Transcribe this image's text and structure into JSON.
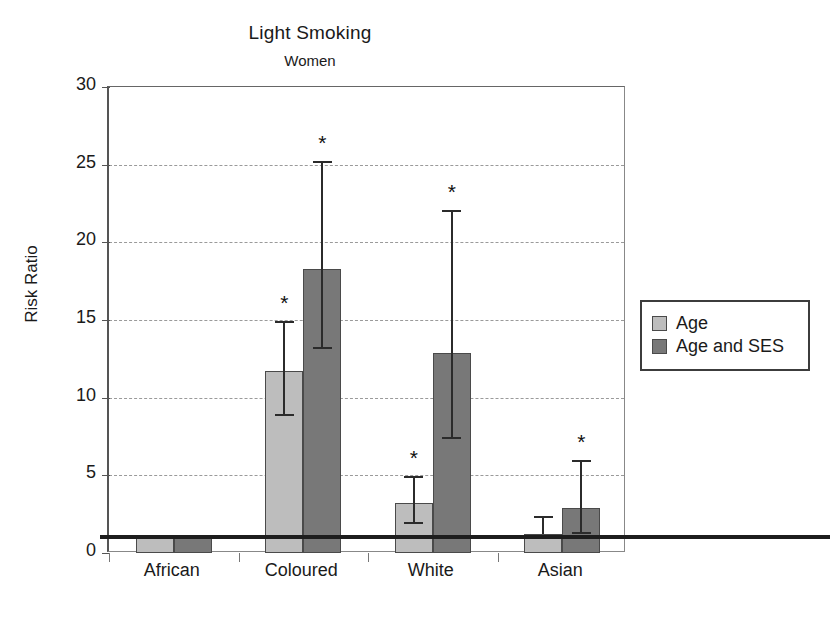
{
  "chart_data": {
    "type": "bar",
    "title": "Light Smoking",
    "subtitle": "Women",
    "xlabel": "",
    "ylabel": "Risk Ratio",
    "ylim": [
      0,
      30
    ],
    "yticks": [
      0,
      5,
      10,
      15,
      20,
      25,
      30
    ],
    "grid": "horizontal-dashed",
    "legend_position": "right",
    "reference_line": 1.0,
    "categories": [
      "African",
      "Coloured",
      "White",
      "Asian"
    ],
    "series": [
      {
        "name": "Age",
        "color": "#bdbdbd",
        "values": [
          1.0,
          11.7,
          3.2,
          1.2
        ],
        "ci_low": [
          null,
          8.9,
          1.9,
          null
        ],
        "ci_high": [
          null,
          14.9,
          4.9,
          2.3
        ],
        "significant": [
          false,
          true,
          true,
          false
        ]
      },
      {
        "name": "Age and SES",
        "color": "#787878",
        "values": [
          1.0,
          18.3,
          12.9,
          2.9
        ],
        "ci_low": [
          null,
          13.2,
          7.4,
          1.3
        ],
        "ci_high": [
          null,
          25.2,
          22.0,
          5.9
        ],
        "significant": [
          false,
          true,
          true,
          true
        ]
      }
    ],
    "significance_marker": "*"
  },
  "legend": {
    "items": [
      {
        "label": "Age",
        "color": "#bdbdbd"
      },
      {
        "label": "Age and SES",
        "color": "#787878"
      }
    ]
  }
}
